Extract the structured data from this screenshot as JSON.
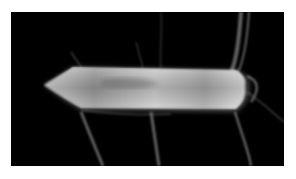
{
  "image": {
    "subject": "glowing smoky arrow pointing left",
    "background_color": "#000000",
    "border_color": "#ffffff",
    "arrow_direction": "left"
  }
}
